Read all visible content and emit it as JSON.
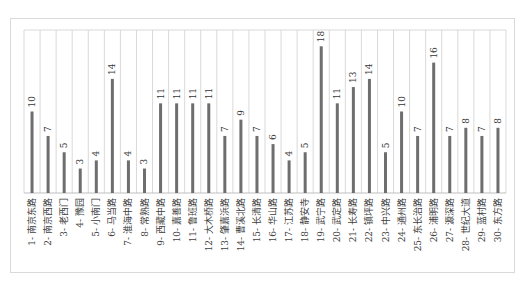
{
  "chart_data": {
    "type": "bar",
    "orientation": "vertical",
    "title": "",
    "xlabel": "",
    "ylabel": "",
    "ylim": [
      0,
      20
    ],
    "grid": "vertical category separators",
    "legend": "none",
    "bar_color": "#6e6e6e",
    "grid_color": "#d9d9d9",
    "categories": [
      "1- 南京东路",
      "2- 南京西路",
      "3- 老西门",
      "4- 豫园",
      "5- 小南门",
      "6- 马当路",
      "7- 淮海中路",
      "8- 常熟路",
      "9- 西藏中路",
      "10- 嘉善路",
      "11- 鲁班路",
      "12- 大木桥路",
      "13- 肇嘉浜路",
      "14- 曹溪北路",
      "15- 长清路",
      "16- 华山路",
      "17- 江苏路",
      "18- 静安寺",
      "19- 武宁路",
      "20- 武定路",
      "21- 长寿路",
      "22- 镇坪路",
      "23- 中兴路",
      "24- 通州路",
      "25- 东长治路",
      "26- 浦明路",
      "27- 源深路",
      "28- 世纪大道",
      "29- 蓝村路",
      "30- 东方路"
    ],
    "values": [
      10,
      7,
      5,
      3,
      4,
      14,
      4,
      3,
      11,
      11,
      11,
      11,
      7,
      9,
      7,
      6,
      4,
      5,
      18,
      11,
      13,
      14,
      5,
      10,
      7,
      16,
      7,
      8,
      7,
      8
    ],
    "data_labels": [
      "10",
      "7",
      "5",
      "3",
      "4",
      "14",
      "4",
      "3",
      "11",
      "11",
      "11",
      "11",
      "7",
      "9",
      "7",
      "6",
      "4",
      "5",
      "18",
      "11",
      "13",
      "14",
      "5",
      "10",
      "7",
      "16",
      "7",
      "8",
      "7",
      "8"
    ]
  }
}
